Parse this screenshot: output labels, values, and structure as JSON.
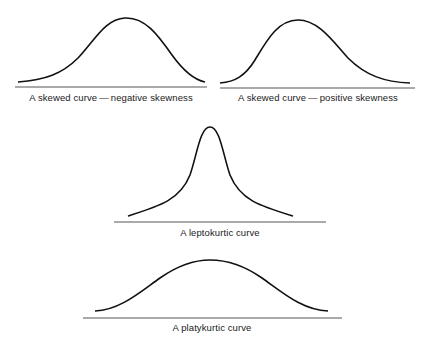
{
  "figure": {
    "panels": [
      {
        "id": "negative-skew",
        "label": "A skewed curve — negative skewness",
        "shape": "skewed-left",
        "peak_x_fraction": 0.57
      },
      {
        "id": "positive-skew",
        "label": "A skewed curve — positive skewness",
        "shape": "skewed-right",
        "peak_x_fraction": 0.41
      },
      {
        "id": "leptokurtic",
        "label": "A leptokurtic curve",
        "shape": "tall-narrow-peak"
      },
      {
        "id": "platykurtic",
        "label": "A platykurtic curve",
        "shape": "flat-wide-peak"
      }
    ],
    "colors": {
      "curve": "#111111",
      "baseline": "#555555",
      "text": "#1a1a1a",
      "background": "#ffffff"
    }
  }
}
